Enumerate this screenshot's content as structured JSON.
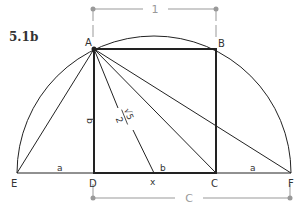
{
  "figure": {
    "label": "5.1b"
  },
  "points": {
    "A": "A",
    "B": "B",
    "C": "C",
    "D": "D",
    "E": "E",
    "F": "F",
    "x": "x"
  },
  "segments": {
    "ED": "a",
    "CF": "a",
    "AD": "b",
    "xC": "b",
    "Ax_num": "√5",
    "Ax_den": "2"
  },
  "dimensions": {
    "top": "1",
    "bottom": "C"
  },
  "colors": {
    "line": "#222222",
    "dimension": "#999999"
  }
}
